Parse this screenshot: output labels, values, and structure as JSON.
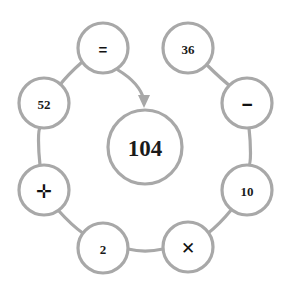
{
  "diagram": {
    "type": "circular-node-graph",
    "background_color": "#ffffff",
    "stroke_color": "#a8a8a8",
    "text_color": "#1a1a1a",
    "stroke_width": 3.2,
    "center": {
      "label": "104",
      "cx": 145,
      "cy": 147,
      "r": 37,
      "font_size": 23
    },
    "arrow": {
      "name": "equals-to-result-arrow",
      "from_node": "=",
      "to_node": "104",
      "path": "M 118 70 C 133 79 141 88 144 100",
      "head_points": "144,108 138,95 150,95"
    },
    "nodes": [
      {
        "id": "equals",
        "label": "=",
        "kind": "operator",
        "cx": 103,
        "cy": 48,
        "r": 25,
        "font_size": 15
      },
      {
        "id": "n36",
        "label": "36",
        "kind": "number",
        "cx": 188,
        "cy": 48,
        "r": 25,
        "font_size": 13
      },
      {
        "id": "minus",
        "label": "−",
        "kind": "operator",
        "cx": 247,
        "cy": 103,
        "r": 25,
        "font_size": 19
      },
      {
        "id": "n10",
        "label": "10",
        "kind": "number",
        "cx": 247,
        "cy": 190,
        "r": 25,
        "font_size": 13
      },
      {
        "id": "times",
        "label": "✕",
        "kind": "operator",
        "cx": 188,
        "cy": 247,
        "r": 25,
        "font_size": 17
      },
      {
        "id": "n2",
        "label": "2",
        "kind": "number",
        "cx": 103,
        "cy": 248,
        "r": 25,
        "font_size": 13
      },
      {
        "id": "plus",
        "label": "✛",
        "kind": "operator",
        "cx": 44,
        "cy": 190,
        "r": 25,
        "font_size": 19
      },
      {
        "id": "n52",
        "label": "52",
        "kind": "number",
        "cx": 44,
        "cy": 103,
        "r": 25,
        "font_size": 13
      }
    ],
    "edges": [
      {
        "from": "n36",
        "to": "minus",
        "path": "M 207 65  C 216 74 226 83 235 90"
      },
      {
        "from": "minus",
        "to": "n10",
        "path": "M 249 128 C 251 145 251 165 249 165"
      },
      {
        "from": "n10",
        "to": "times",
        "path": "M 232 209 C 223 220 215 228 207 234"
      },
      {
        "from": "times",
        "to": "n2",
        "path": "M 163 249 C 150 252 140 252 128 249"
      },
      {
        "from": "n2",
        "to": "plus",
        "path": "M 84 234 C 74 227 66 219 58 210"
      },
      {
        "from": "plus",
        "to": "n52",
        "path": "M 40 165 C 38 147 38 130 40 128"
      },
      {
        "from": "n52",
        "to": "equals",
        "path": "M 59 86  C 66 77 73 70 81 63"
      }
    ]
  }
}
